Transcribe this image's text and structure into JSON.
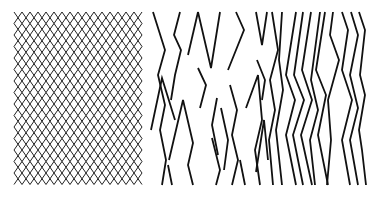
{
  "figure": {
    "width": 378,
    "height": 200,
    "background": "#ffffff",
    "stroke_color": "#111111",
    "panels": [
      {
        "name": "dense-lattice",
        "description": "regular crossing zigzag lines forming a diamond lattice",
        "x_start": 18,
        "x_end": 144,
        "y_start": 12,
        "y_end": 185,
        "column_spacing": 8,
        "half_period": 11.5,
        "amplitude": 4
      },
      {
        "name": "sparse-broken-zigzags",
        "strokes": [
          [
            [
              153,
              12
            ],
            [
              165,
              50
            ],
            [
              158,
              75
            ],
            [
              165,
              105
            ],
            [
              160,
              130
            ],
            [
              166,
              160
            ],
            [
              162,
              185
            ]
          ],
          [
            [
              180,
              12
            ],
            [
              174,
              35
            ],
            [
              181,
              50
            ],
            [
              175,
              75
            ],
            [
              171,
              100
            ]
          ],
          [
            [
              198,
              12
            ],
            [
              188,
              55
            ]
          ],
          [
            [
              198,
              12
            ],
            [
              211,
              68
            ],
            [
              220,
              12
            ]
          ],
          [
            [
              236,
              12
            ],
            [
              244,
              30
            ],
            [
              228,
              70
            ]
          ],
          [
            [
              256,
              12
            ],
            [
              262,
              45
            ],
            [
              267,
              12
            ]
          ],
          [
            [
              151,
              130
            ],
            [
              162,
              78
            ],
            [
              175,
              120
            ]
          ],
          [
            [
              169,
              160
            ],
            [
              183,
              100
            ],
            [
              193,
              143
            ],
            [
              188,
              165
            ],
            [
              193,
              185
            ]
          ],
          [
            [
              198,
              68
            ],
            [
              206,
              85
            ],
            [
              200,
              108
            ]
          ],
          [
            [
              221,
              108
            ],
            [
              228,
              140
            ],
            [
              224,
              170
            ]
          ],
          [
            [
              217,
              98
            ],
            [
              212,
              125
            ],
            [
              218,
              155
            ]
          ],
          [
            [
              230,
              85
            ],
            [
              237,
              110
            ],
            [
              232,
              135
            ],
            [
              238,
              160
            ],
            [
              232,
              185
            ]
          ],
          [
            [
              212,
              138
            ],
            [
              220,
              170
            ],
            [
              216,
              185
            ]
          ],
          [
            [
              246,
              108
            ],
            [
              258,
              75
            ],
            [
              262,
              120
            ],
            [
              255,
              150
            ],
            [
              260,
              185
            ]
          ],
          [
            [
              240,
              160
            ],
            [
              245,
              185
            ]
          ],
          [
            [
              256,
              172
            ],
            [
              264,
              120
            ],
            [
              268,
              160
            ]
          ],
          [
            [
              168,
              165
            ],
            [
              172,
              185
            ]
          ],
          [
            [
              257,
              60
            ],
            [
              265,
              80
            ],
            [
              262,
              100
            ]
          ]
        ]
      },
      {
        "name": "parallel-zigzags",
        "strokes": [
          [
            [
              296,
              12
            ],
            [
              286,
              75
            ],
            [
              295,
              100
            ],
            [
              286,
              135
            ],
            [
              296,
              185
            ]
          ],
          [
            [
              303,
              12
            ],
            [
              294,
              75
            ],
            [
              304,
              100
            ],
            [
              293,
              135
            ],
            [
              303,
              185
            ]
          ],
          [
            [
              311,
              12
            ],
            [
              302,
              70
            ],
            [
              312,
              100
            ],
            [
              301,
              135
            ],
            [
              312,
              185
            ]
          ],
          [
            [
              320,
              12
            ],
            [
              311,
              80
            ],
            [
              318,
              110
            ],
            [
              310,
              140
            ],
            [
              315,
              185
            ]
          ],
          [
            [
              325,
              12
            ],
            [
              316,
              70
            ],
            [
              326,
              95
            ],
            [
              318,
              135
            ],
            [
              328,
              185
            ]
          ],
          [
            [
              333,
              12
            ],
            [
              330,
              35
            ],
            [
              339,
              60
            ],
            [
              328,
              100
            ],
            [
              331,
              140
            ],
            [
              327,
              185
            ]
          ],
          [
            [
              342,
              12
            ],
            [
              348,
              30
            ],
            [
              342,
              70
            ],
            [
              352,
              100
            ],
            [
              342,
              140
            ],
            [
              350,
              185
            ]
          ],
          [
            [
              351,
              12
            ],
            [
              358,
              35
            ],
            [
              350,
              75
            ],
            [
              358,
              108
            ],
            [
              350,
              140
            ],
            [
              358,
              185
            ]
          ],
          [
            [
              359,
              12
            ],
            [
              365,
              30
            ],
            [
              360,
              75
            ],
            [
              365,
              95
            ],
            [
              359,
              130
            ],
            [
              362,
              150
            ],
            [
              366,
              185
            ]
          ],
          [
            [
              272,
              12
            ],
            [
              278,
              50
            ],
            [
              270,
              80
            ],
            [
              275,
              110
            ],
            [
              269,
              140
            ],
            [
              273,
              185
            ]
          ],
          [
            [
              282,
              12
            ],
            [
              279,
              60
            ],
            [
              283,
              90
            ],
            [
              276,
              130
            ],
            [
              282,
              185
            ]
          ]
        ]
      }
    ]
  }
}
